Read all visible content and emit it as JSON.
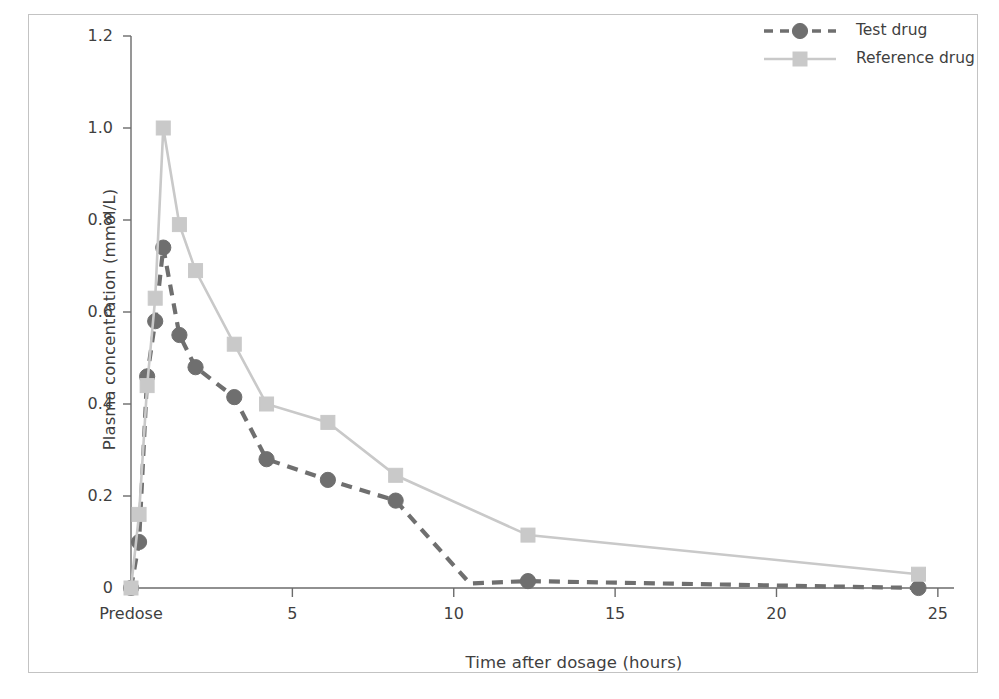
{
  "figure": {
    "cut_off_header_text": "",
    "frame_color": "#c3c3c3",
    "background": "#ffffff"
  },
  "chart_data": {
    "type": "line",
    "title": "",
    "subtitle": "",
    "xlabel": "Time after dosage (hours)",
    "ylabel": "Plasma concentration (mmol/L)",
    "xlim": [
      0,
      25.5
    ],
    "ylim": [
      0,
      1.2
    ],
    "grid": false,
    "legend_position": "top-right",
    "x_tick_values": [
      0,
      5,
      10,
      15,
      20,
      25
    ],
    "x_tick_labels": [
      "Predose",
      "5",
      "10",
      "15",
      "20",
      "25"
    ],
    "y_tick_values": [
      0,
      0.2,
      0.4,
      0.6,
      0.8,
      1.0,
      1.2
    ],
    "y_tick_labels": [
      "0",
      "0.2",
      "0.4",
      "0.6",
      "0.8",
      "1.0",
      "1.2"
    ],
    "series": [
      {
        "name": "Test drug",
        "color": "#6f6f6f",
        "linestyle": "dashed",
        "marker": "circle",
        "x": [
          0,
          0.25,
          0.5,
          0.75,
          1.0,
          1.5,
          2.0,
          3.2,
          4.2,
          6.1,
          8.2,
          10.5,
          12.3,
          24.4
        ],
        "values": [
          0,
          0.1,
          0.46,
          0.58,
          0.74,
          0.55,
          0.48,
          0.415,
          0.28,
          0.235,
          0.19,
          0.01,
          0.015,
          0.0
        ],
        "marker_x": [
          0,
          0.25,
          0.5,
          0.75,
          1.0,
          1.5,
          2.0,
          3.2,
          4.2,
          6.1,
          8.2,
          12.3,
          24.4
        ],
        "marker_values": [
          0,
          0.1,
          0.46,
          0.58,
          0.74,
          0.55,
          0.48,
          0.415,
          0.28,
          0.235,
          0.19,
          0.015,
          0.0
        ]
      },
      {
        "name": "Reference drug",
        "color": "#c9c9c9",
        "linestyle": "solid",
        "marker": "square",
        "x": [
          0,
          0.25,
          0.5,
          0.75,
          1.0,
          1.5,
          2.0,
          3.2,
          4.2,
          6.1,
          8.2,
          12.3,
          24.4
        ],
        "values": [
          0,
          0.16,
          0.44,
          0.63,
          1.0,
          0.79,
          0.69,
          0.53,
          0.4,
          0.36,
          0.245,
          0.115,
          0.03
        ],
        "marker_x": [
          0,
          0.25,
          0.5,
          0.75,
          1.0,
          1.5,
          2.0,
          3.2,
          4.2,
          6.1,
          8.2,
          12.3,
          24.4
        ],
        "marker_values": [
          0,
          0.16,
          0.44,
          0.63,
          1.0,
          0.79,
          0.69,
          0.53,
          0.4,
          0.36,
          0.245,
          0.115,
          0.03
        ]
      }
    ]
  },
  "legend": {
    "entries": [
      {
        "label": "Test drug",
        "color": "#6f6f6f",
        "marker": "circle",
        "linestyle": "dashed"
      },
      {
        "label": "Reference drug",
        "color": "#c9c9c9",
        "marker": "square",
        "linestyle": "solid"
      }
    ]
  }
}
